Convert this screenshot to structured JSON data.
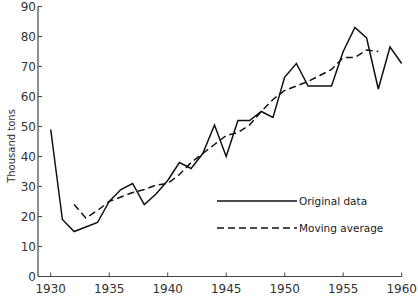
{
  "chart_data": {
    "type": "line",
    "title": "",
    "xlabel": "",
    "ylabel": "Thousand tons",
    "xlim": [
      1930,
      1960
    ],
    "ylim": [
      0,
      90
    ],
    "x_ticks": [
      1930,
      1935,
      1940,
      1945,
      1950,
      1955,
      1960
    ],
    "y_ticks": [
      0,
      10,
      20,
      30,
      40,
      50,
      60,
      70,
      80,
      90
    ],
    "grid": false,
    "legend_position": "lower right (inside)",
    "series": [
      {
        "name": "Original data",
        "style": "solid",
        "x": [
          1930,
          1931,
          1932,
          1933,
          1934,
          1935,
          1936,
          1937,
          1938,
          1939,
          1940,
          1941,
          1942,
          1943,
          1944,
          1945,
          1946,
          1947,
          1948,
          1949,
          1950,
          1951,
          1952,
          1953,
          1954,
          1955,
          1956,
          1957,
          1958,
          1959,
          1960
        ],
        "values": [
          49,
          19,
          15,
          16.5,
          18,
          25,
          29,
          31,
          24,
          27.5,
          32,
          38,
          36,
          41,
          50.5,
          40,
          52,
          52,
          55,
          53,
          66.5,
          71,
          63.5,
          63.5,
          63.5,
          75,
          83,
          79.5,
          62.5,
          76.5,
          71
        ]
      },
      {
        "name": "Moving average",
        "style": "dashed",
        "x": [
          1932,
          1933,
          1934,
          1935,
          1936,
          1937,
          1938,
          1939,
          1940,
          1941,
          1942,
          1943,
          1944,
          1945,
          1946,
          1947,
          1948,
          1949,
          1950,
          1951,
          1952,
          1953,
          1954,
          1955,
          1956,
          1957,
          1958
        ],
        "values": [
          24,
          19.5,
          22,
          25,
          26.5,
          28,
          29,
          30.5,
          31,
          34,
          38,
          41,
          44,
          47,
          48,
          50.5,
          55,
          59,
          62,
          63.5,
          65,
          67,
          69,
          73,
          73,
          75.5,
          75
        ]
      }
    ]
  },
  "legend": {
    "original": "Original data",
    "moving": "Moving average"
  },
  "axis": {
    "ylabel": "Thousand tons"
  }
}
